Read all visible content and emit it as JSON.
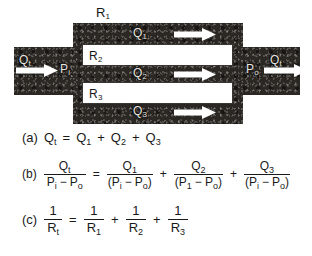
{
  "figure": {
    "top_label": "R",
    "top_label_sub": "1",
    "channels": [
      {
        "label": "R",
        "sub": "2"
      },
      {
        "label": "R",
        "sub": "3"
      }
    ],
    "flow_labels": [
      {
        "q": "Q",
        "sub": "1"
      },
      {
        "q": "Q",
        "sub": "2"
      },
      {
        "q": "Q",
        "sub": "3"
      }
    ],
    "inlet": {
      "flow": "Q",
      "flow_sub": "t",
      "pressure": "P",
      "pressure_sub": "i"
    },
    "outlet": {
      "flow": "Q",
      "flow_sub": "t",
      "pressure": "P",
      "pressure_sub": "o"
    },
    "arrow_icon": "right-arrow-icon"
  },
  "equations": {
    "a": {
      "tag": "(a)",
      "lhs": {
        "sym": "Q",
        "sub": "t"
      },
      "eq": "=",
      "terms": [
        {
          "sym": "Q",
          "sub": "1"
        },
        {
          "sym": "Q",
          "sub": "2"
        },
        {
          "sym": "Q",
          "sub": "3"
        }
      ],
      "plus": "+"
    },
    "b": {
      "tag": "(b)",
      "eq": "=",
      "plus": "+",
      "lhs": {
        "num_sym": "Q",
        "num_sub": "t",
        "den": [
          {
            "sym": "P",
            "sub": "i"
          },
          {
            "op": "−"
          },
          {
            "sym": "P",
            "sub": "o"
          }
        ]
      },
      "terms": [
        {
          "num_sym": "Q",
          "num_sub": "1",
          "den_open": "(",
          "den_close": ")",
          "den": [
            {
              "sym": "P",
              "sub": "i"
            },
            {
              "op": "−"
            },
            {
              "sym": "P",
              "sub": "o"
            }
          ]
        },
        {
          "num_sym": "Q",
          "num_sub": "2",
          "den_open": "(",
          "den_close": ")",
          "den": [
            {
              "sym": "P",
              "sub": "1"
            },
            {
              "op": "−"
            },
            {
              "sym": "P",
              "sub": "o"
            }
          ]
        },
        {
          "num_sym": "Q",
          "num_sub": "3",
          "den_open": "(",
          "den_close": ")",
          "den": [
            {
              "sym": "P",
              "sub": "i"
            },
            {
              "op": "−"
            },
            {
              "sym": "P",
              "sub": "o"
            }
          ]
        }
      ]
    },
    "c": {
      "tag": "(c)",
      "eq": "=",
      "plus": "+",
      "one": "1",
      "lhs": {
        "sym": "R",
        "sub": "t"
      },
      "terms": [
        {
          "sym": "R",
          "sub": "1"
        },
        {
          "sym": "R",
          "sub": "2"
        },
        {
          "sym": "R",
          "sub": "3"
        }
      ]
    }
  },
  "colors": {
    "block": "#2b2824",
    "channel": "#ffffff",
    "arrow": "#ffffff",
    "text": "#1a1a1a"
  }
}
